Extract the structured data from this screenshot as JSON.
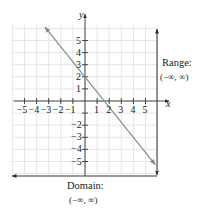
{
  "chart_data": {
    "type": "line",
    "title": "",
    "xlabel": "x",
    "ylabel": "y",
    "xlim": [
      -6,
      6
    ],
    "ylim": [
      -6,
      6
    ],
    "grid": true,
    "x_ticks": [
      -5,
      -4,
      -3,
      -2,
      -1,
      1,
      2,
      3,
      4,
      5
    ],
    "y_ticks": [
      -5,
      -4,
      -3,
      -2,
      1,
      2,
      3,
      4,
      5
    ],
    "x_tick_labels": [
      "−5",
      "−4",
      "−3",
      "−2",
      "−1",
      "1",
      "2",
      "3",
      "4",
      "5"
    ],
    "y_tick_labels": [
      "−5",
      "−4",
      "−3",
      "−2",
      "1",
      "2",
      "3",
      "4",
      "5"
    ],
    "series": [
      {
        "name": "line",
        "equation": "y = -1.25x + 2",
        "slope": -1.25,
        "y_intercept": 2,
        "x_intercept": 1.6,
        "x": [
          -3.3,
          5.8
        ],
        "y": [
          6.1,
          -5.25
        ],
        "arrows": "both",
        "color": "#8a8a8a"
      }
    ],
    "annotations": [
      {
        "label": "Range:",
        "value": "(−∞, ∞)",
        "type": "vertical-arrow-line"
      },
      {
        "label": "Domain:",
        "value": "(−∞, ∞)",
        "type": "horizontal-arrow-line"
      }
    ]
  },
  "labels": {
    "x_axis": "x",
    "y_axis": "y",
    "range_title": "Range:",
    "range_value": "(−∞, ∞)",
    "domain_title": "Domain:",
    "domain_value": "(−∞, ∞)"
  },
  "colors": {
    "grid": "#e6e6e6",
    "axis": "#333333",
    "line": "#8a8a8a",
    "annotation": "#333333"
  }
}
